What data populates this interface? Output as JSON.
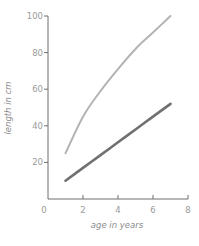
{
  "chart_data": {
    "type": "line",
    "title": "",
    "xlabel": "age in years",
    "ylabel": "length in cm",
    "xlim": [
      0,
      8
    ],
    "ylim": [
      0,
      100
    ],
    "x_ticks": [
      0,
      2,
      4,
      6,
      8
    ],
    "y_ticks": [
      20,
      40,
      60,
      80,
      100
    ],
    "grid": false,
    "legend": null,
    "x": [
      1,
      2,
      3,
      4,
      5,
      6,
      7
    ],
    "series": [
      {
        "name": "upper curve (light gray)",
        "color": "#b3b3b3",
        "values": [
          25,
          45,
          59,
          71,
          82,
          91,
          100
        ]
      },
      {
        "name": "lower curve (dark gray)",
        "color": "#707070",
        "values": [
          10,
          17,
          24,
          31,
          38,
          45,
          52
        ]
      }
    ]
  },
  "colors": {
    "axis": "#6e6e6e",
    "tick_text": "#9a9a9a"
  }
}
